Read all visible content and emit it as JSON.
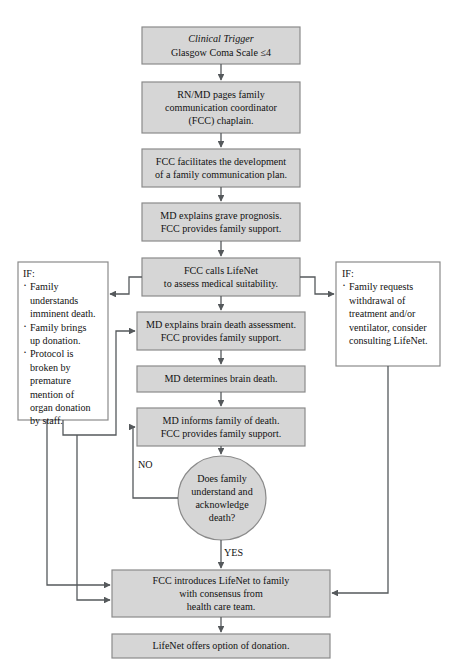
{
  "diagram": {
    "colors": {
      "node_fill": "#d6d6d6",
      "node_border": "#8a8a8a",
      "note_fill": "#ffffff",
      "connector": "#55595c",
      "page_background": "#ffffff",
      "text": "#111111"
    },
    "nodes": {
      "clinical_trigger": {
        "line1": "Clinical Trigger",
        "line2": "Glasgow Coma Scale ≤4"
      },
      "rn_md_pages": {
        "line1": "RN/MD pages family",
        "line2": "communication coordinator",
        "line3": "(FCC) chaplain."
      },
      "fcc_facilitates": {
        "line1": "FCC facilitates the development",
        "line2": "of a family communication plan."
      },
      "md_explains_prognosis": {
        "line1": "MD explains grave prognosis.",
        "line2": "FCC provides family support."
      },
      "fcc_calls_lifenet": {
        "line1": "FCC calls LifeNet",
        "line2": "to assess medical suitability."
      },
      "md_explains_brain_death": {
        "line1": "MD explains brain death assessment.",
        "line2": "FCC provides family support."
      },
      "md_determines_brain_death": {
        "line1": "MD determines brain death."
      },
      "md_informs_family": {
        "line1": "MD informs family of death.",
        "line2": "FCC provides family support."
      },
      "decision_family_understands": {
        "line1": "Does family",
        "line2": "understand and",
        "line3": "acknowledge",
        "line4": "death?"
      },
      "fcc_introduces_lifenet": {
        "line1": "FCC introduces LifeNet to family",
        "line2": "with consensus from",
        "line3": "health care team."
      },
      "lifenet_offers_option": {
        "line1": "LifeNet offers option of donation."
      }
    },
    "notes": {
      "left_if": {
        "header": "IF:",
        "bullets": [
          "Family understands imminent death.",
          "Family brings up donation.",
          "Protocol is broken by premature mention of organ donation by staff."
        ],
        "wrapped_lines": [
          "Family",
          "understands",
          "imminent death.",
          "Family brings",
          "up donation.",
          "Protocol is",
          "broken by",
          "premature",
          "mention of",
          "organ donation",
          "by staff."
        ]
      },
      "right_if": {
        "header": "IF:",
        "bullets": [
          "Family requests withdrawal of treatment and/or ventilator, consider consulting LifeNet."
        ],
        "wrapped_lines": [
          "Family requests",
          "withdrawal of",
          "treatment and/or",
          "ventilator, consider",
          "consulting LifeNet."
        ]
      }
    },
    "edge_labels": {
      "no": "NO",
      "yes": "YES"
    }
  }
}
